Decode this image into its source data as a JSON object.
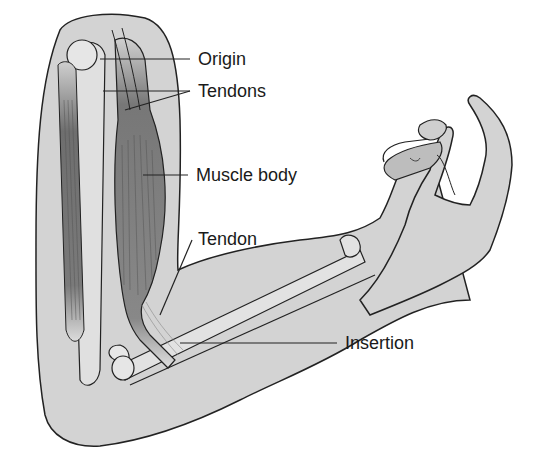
{
  "diagram": {
    "labels": {
      "origin": "Origin",
      "tendons": "Tendons",
      "muscle_body": "Muscle body",
      "tendon": "Tendon",
      "insertion": "Insertion"
    },
    "colors": {
      "skin": "#d6d6d6",
      "skin_dark": "#c4c4c4",
      "muscle": "#7a7a7a",
      "bone": "#e2e2e2",
      "outline": "#222222",
      "text": "#1a1a1a"
    }
  }
}
